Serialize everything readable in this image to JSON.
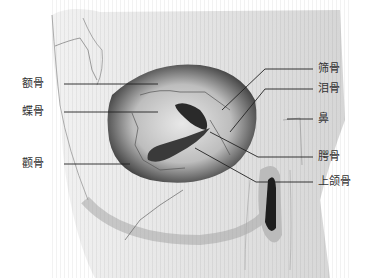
{
  "diagram": {
    "labels_left": [
      {
        "id": "frontal",
        "text": "额骨",
        "x": 40,
        "y": 77
      },
      {
        "id": "sphenoid",
        "text": "蝶骨",
        "x": 40,
        "y": 105
      },
      {
        "id": "zygomatic",
        "text": "颧骨",
        "x": 40,
        "y": 157
      }
    ],
    "labels_right": [
      {
        "id": "ethmoid",
        "text": "筛骨",
        "x": 318,
        "y": 62
      },
      {
        "id": "lacrimal",
        "text": "泪骨",
        "x": 318,
        "y": 82
      },
      {
        "id": "nasal",
        "text": "鼻",
        "x": 318,
        "y": 112
      },
      {
        "id": "palatine",
        "text": "腭骨",
        "x": 318,
        "y": 150
      },
      {
        "id": "maxilla",
        "text": "上颌骨",
        "x": 318,
        "y": 175
      }
    ]
  }
}
